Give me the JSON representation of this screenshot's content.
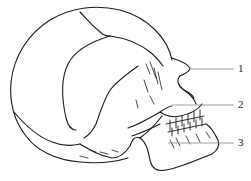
{
  "diagram": {
    "stroke_color": "#1a1a1a",
    "leader_color": "#888888",
    "labels": [
      {
        "id": "1",
        "text": "1",
        "x": 238,
        "y": 63,
        "line_from": [
          190,
          69
        ],
        "line_to": [
          234,
          69
        ]
      },
      {
        "id": "2",
        "text": "2",
        "x": 238,
        "y": 99,
        "line_from": [
          172,
          105
        ],
        "line_to": [
          234,
          105
        ]
      },
      {
        "id": "3",
        "text": "3",
        "x": 238,
        "y": 137,
        "line_from": [
          168,
          143
        ],
        "line_to": [
          234,
          143
        ]
      }
    ]
  }
}
